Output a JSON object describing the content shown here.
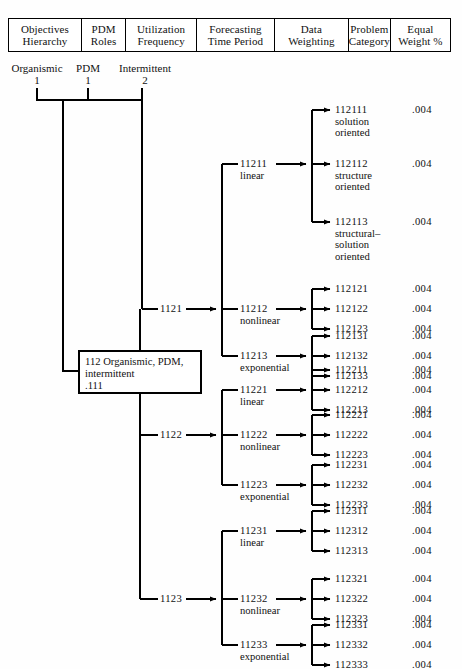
{
  "header": {
    "columns": [
      {
        "line1": "Objectives",
        "line2": "Hierarchy"
      },
      {
        "line1": "PDM",
        "line2": "Roles"
      },
      {
        "line1": "Utilization",
        "line2": "Frequency"
      },
      {
        "line1": "Forecasting",
        "line2": "Time Period"
      },
      {
        "line1": "Data",
        "line2": "Weighting"
      },
      {
        "line1": "Problem",
        "line2": "Category"
      },
      {
        "line1": "Equal",
        "line2": "Weight %"
      }
    ]
  },
  "level_captions": [
    {
      "label": "Organismic",
      "value": "1"
    },
    {
      "label": "PDM",
      "value": "1"
    },
    {
      "label": "Intermittent",
      "value": "2"
    }
  ],
  "root_box": {
    "line1": "112 Organismic, PDM,",
    "line2": "intermittent",
    "line3": ".111"
  },
  "time_period_nodes": [
    {
      "code": "1121"
    },
    {
      "code": "1122"
    },
    {
      "code": "1123"
    }
  ],
  "weighting_nodes": [
    {
      "code": "11211",
      "kind": "linear"
    },
    {
      "code": "11212",
      "kind": "nonlinear"
    },
    {
      "code": "11213",
      "kind": "exponential"
    },
    {
      "code": "11221",
      "kind": "linear"
    },
    {
      "code": "11222",
      "kind": "nonlinear"
    },
    {
      "code": "11223",
      "kind": "exponential"
    },
    {
      "code": "11231",
      "kind": "linear"
    },
    {
      "code": "11232",
      "kind": "nonlinear"
    },
    {
      "code": "11233",
      "kind": "exponential"
    }
  ],
  "problem_categories": [
    {
      "code": "112111",
      "desc1": "solution",
      "desc2": "oriented",
      "desc3": "",
      "weight": ".004"
    },
    {
      "code": "112112",
      "desc1": "structure",
      "desc2": "oriented",
      "desc3": "",
      "weight": ".004"
    },
    {
      "code": "112113",
      "desc1": "structural–",
      "desc2": "solution",
      "desc3": "oriented",
      "weight": ".004"
    },
    {
      "code": "112121",
      "desc1": "",
      "desc2": "",
      "desc3": "",
      "weight": ".004"
    },
    {
      "code": "112122",
      "desc1": "",
      "desc2": "",
      "desc3": "",
      "weight": ".004"
    },
    {
      "code": "112123",
      "desc1": "",
      "desc2": "",
      "desc3": "",
      "weight": ".004"
    },
    {
      "code": "112131",
      "desc1": "",
      "desc2": "",
      "desc3": "",
      "weight": ".004"
    },
    {
      "code": "112132",
      "desc1": "",
      "desc2": "",
      "desc3": "",
      "weight": ".004"
    },
    {
      "code": "112133",
      "desc1": "",
      "desc2": "",
      "desc3": "",
      "weight": ".004"
    },
    {
      "code": "112211",
      "desc1": "",
      "desc2": "",
      "desc3": "",
      "weight": ".004"
    },
    {
      "code": "112212",
      "desc1": "",
      "desc2": "",
      "desc3": "",
      "weight": ".004"
    },
    {
      "code": "112213",
      "desc1": "",
      "desc2": "",
      "desc3": "",
      "weight": ".004"
    },
    {
      "code": "112221",
      "desc1": "",
      "desc2": "",
      "desc3": "",
      "weight": ".004"
    },
    {
      "code": "112222",
      "desc1": "",
      "desc2": "",
      "desc3": "",
      "weight": ".004"
    },
    {
      "code": "112223",
      "desc1": "",
      "desc2": "",
      "desc3": "",
      "weight": ".004"
    },
    {
      "code": "112231",
      "desc1": "",
      "desc2": "",
      "desc3": "",
      "weight": ".004"
    },
    {
      "code": "112232",
      "desc1": "",
      "desc2": "",
      "desc3": "",
      "weight": ".004"
    },
    {
      "code": "112233",
      "desc1": "",
      "desc2": "",
      "desc3": "",
      "weight": ".004"
    },
    {
      "code": "112311",
      "desc1": "",
      "desc2": "",
      "desc3": "",
      "weight": ".004"
    },
    {
      "code": "112312",
      "desc1": "",
      "desc2": "",
      "desc3": "",
      "weight": ".004"
    },
    {
      "code": "112313",
      "desc1": "",
      "desc2": "",
      "desc3": "",
      "weight": ".004"
    },
    {
      "code": "112321",
      "desc1": "",
      "desc2": "",
      "desc3": "",
      "weight": ".004"
    },
    {
      "code": "112322",
      "desc1": "",
      "desc2": "",
      "desc3": "",
      "weight": ".004"
    },
    {
      "code": "112323",
      "desc1": "",
      "desc2": "",
      "desc3": "",
      "weight": ".004"
    },
    {
      "code": "112331",
      "desc1": "",
      "desc2": "",
      "desc3": "",
      "weight": ".004"
    },
    {
      "code": "112332",
      "desc1": "",
      "desc2": "",
      "desc3": "",
      "weight": ".004"
    },
    {
      "code": "112333",
      "desc1": "",
      "desc2": "",
      "desc3": "",
      "weight": ".004"
    }
  ],
  "colors": {
    "ink": "#111111",
    "rule": "#000000",
    "paper": "#fefefe"
  }
}
